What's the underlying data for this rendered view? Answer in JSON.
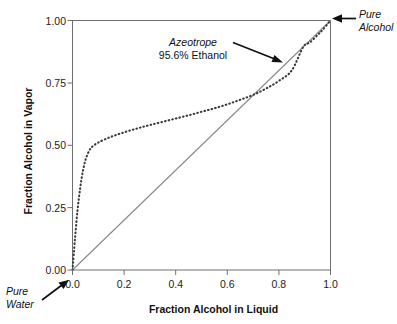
{
  "chart_data": {
    "type": "line",
    "title": "",
    "xlabel": "Fraction Alcohol in Liquid",
    "ylabel": "Fraction Alcohol in Vapor",
    "xlim": [
      0.0,
      1.0
    ],
    "ylim": [
      0.0,
      1.0
    ],
    "grid": false,
    "legend": "none",
    "xticks": [
      "0.0",
      "0.2",
      "0.4",
      "0.6",
      "0.8",
      "1.0"
    ],
    "xtick_values": [
      0.0,
      0.2,
      0.4,
      0.6,
      0.8,
      1.0
    ],
    "yticks": [
      "0.00",
      "0.25",
      "0.50",
      "0.75",
      "1.00"
    ],
    "ytick_values": [
      0.0,
      0.25,
      0.5,
      0.75,
      1.0
    ],
    "series": [
      {
        "name": "Vapor-liquid equilibrium curve",
        "style": "dotted",
        "color": "#3a3a3a",
        "x": [
          0.0,
          0.01,
          0.02,
          0.03,
          0.04,
          0.05,
          0.06,
          0.07,
          0.08,
          0.1,
          0.14,
          0.18,
          0.22,
          0.26,
          0.3,
          0.35,
          0.4,
          0.45,
          0.5,
          0.55,
          0.6,
          0.65,
          0.7,
          0.75,
          0.8,
          0.85,
          0.894,
          0.92,
          0.95,
          0.97,
          1.0
        ],
        "y": [
          0.0,
          0.13,
          0.245,
          0.33,
          0.395,
          0.44,
          0.468,
          0.487,
          0.497,
          0.511,
          0.53,
          0.545,
          0.558,
          0.57,
          0.581,
          0.594,
          0.607,
          0.62,
          0.634,
          0.648,
          0.664,
          0.682,
          0.702,
          0.727,
          0.758,
          0.8,
          0.894,
          0.912,
          0.942,
          0.963,
          1.0
        ]
      },
      {
        "name": "y = x reference diagonal",
        "style": "solid",
        "color": "#888888",
        "x": [
          0.0,
          1.0
        ],
        "y": [
          0.0,
          1.0
        ]
      }
    ],
    "annotations": [
      {
        "name": "azeotrope",
        "line1": "Azeotrope",
        "line2": "95.6% Ethanol",
        "points_to_x": 0.894,
        "points_to_y": 0.894
      },
      {
        "name": "pure-alcohol",
        "line1": "Pure",
        "line2": "Alcohol",
        "points_to_x": 1.0,
        "points_to_y": 1.0
      },
      {
        "name": "pure-water",
        "line1": "Pure",
        "line2": "Water",
        "points_to_x": 0.0,
        "points_to_y": 0.0
      }
    ]
  },
  "axes": {
    "x_title": "Fraction Alcohol in Liquid",
    "y_title": "Fraction Alcohol in Vapor",
    "x_tick_labels": [
      "0.0",
      "0.2",
      "0.4",
      "0.6",
      "0.8",
      "1.0"
    ],
    "y_tick_labels": [
      "0.00",
      "0.25",
      "0.50",
      "0.75",
      "1.00"
    ]
  },
  "annotations": {
    "azeotrope": {
      "title": "Azeotrope",
      "subtitle": "95.6% Ethanol"
    },
    "pure_alcohol": {
      "line1": "Pure",
      "line2": "Alcohol"
    },
    "pure_water": {
      "line1": "Pure",
      "line2": "Water"
    }
  },
  "colors": {
    "curve": "#3a3a3a",
    "diagonal": "#888888",
    "frame": "#666666",
    "text": "#111111",
    "background": "#ffffff"
  }
}
